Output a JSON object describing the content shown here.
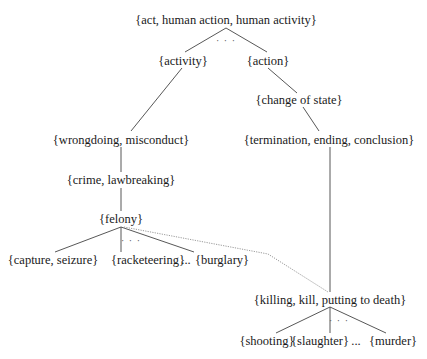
{
  "diagram": {
    "type": "taxonomy-tree",
    "nodes": {
      "act": "{act, human action, human activity}",
      "activity": "{activity}",
      "action": "{action}",
      "change_of_state": "{change of state}",
      "wrongdoing": "{wrongdoing, misconduct}",
      "termination": "{termination, ending, conclusion}",
      "crime": "{crime, lawbreaking}",
      "felony": "{felony}",
      "capture": "{capture, seizure}",
      "racketeering": "{racketeering}",
      "burglary": "{burglary}",
      "killing": "{killing, kill, putting to death}",
      "shooting": "{shooting}",
      "slaughter": "{slaughter}",
      "murder": "{murder}"
    },
    "ellipses": {
      "act_children": "· · ·",
      "felony_children": "· · ·",
      "felony_row": "...",
      "killing_children": "· · ·",
      "killing_row": "..."
    },
    "edges": [
      {
        "from": "act",
        "to": "activity",
        "style": "solid"
      },
      {
        "from": "act",
        "to": "action",
        "style": "solid"
      },
      {
        "from": "activity",
        "to": "wrongdoing",
        "style": "solid"
      },
      {
        "from": "action",
        "to": "change_of_state",
        "style": "solid"
      },
      {
        "from": "change_of_state",
        "to": "termination",
        "style": "solid"
      },
      {
        "from": "wrongdoing",
        "to": "crime",
        "style": "solid"
      },
      {
        "from": "crime",
        "to": "felony",
        "style": "solid"
      },
      {
        "from": "felony",
        "to": "capture",
        "style": "solid"
      },
      {
        "from": "felony",
        "to": "racketeering",
        "style": "solid"
      },
      {
        "from": "felony",
        "to": "burglary",
        "style": "solid"
      },
      {
        "from": "felony",
        "to": "killing",
        "style": "dotted"
      },
      {
        "from": "termination",
        "to": "killing",
        "style": "solid"
      },
      {
        "from": "killing",
        "to": "shooting",
        "style": "solid"
      },
      {
        "from": "killing",
        "to": "slaughter",
        "style": "solid"
      },
      {
        "from": "killing",
        "to": "murder",
        "style": "solid"
      }
    ],
    "colors": {
      "line": "#444444",
      "dotted_line": "#9a9a9a",
      "text": "#1a1a1a",
      "background": "#ffffff"
    }
  }
}
